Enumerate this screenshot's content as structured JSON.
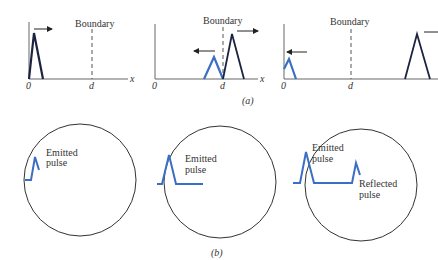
{
  "figure": {
    "part_a": {
      "caption": "(a)",
      "panels": [
        {
          "id": "a1",
          "boundary_label": "Boundary",
          "origin_label": "0",
          "boundary_position_label": "d",
          "axis_label": "x",
          "pulses": [
            {
              "name": "incident-pulse",
              "color": "#1c2340",
              "direction": "right"
            }
          ]
        },
        {
          "id": "a2",
          "boundary_label": "Boundary",
          "origin_label": "0",
          "boundary_position_label": "d",
          "axis_label": "x",
          "pulses": [
            {
              "name": "reflected-pulse",
              "color": "#3a6fc4",
              "direction": "left"
            },
            {
              "name": "transmitted-pulse",
              "color": "#1c2340",
              "direction": "right"
            }
          ]
        },
        {
          "id": "a3",
          "boundary_label": "Boundary",
          "origin_label": "0",
          "boundary_position_label": "d",
          "pulses": [
            {
              "name": "reflected-pulse",
              "color": "#3a6fc4",
              "direction": "left"
            },
            {
              "name": "transmitted-pulse",
              "color": "#1c2340",
              "direction": "right"
            }
          ]
        }
      ]
    },
    "part_b": {
      "caption": "(b)",
      "panels": [
        {
          "id": "b1",
          "labels": {
            "emitted_line1": "Emitted",
            "emitted_line2": "pulse"
          }
        },
        {
          "id": "b2",
          "labels": {
            "emitted_line1": "Emitted",
            "emitted_line2": "pulse"
          }
        },
        {
          "id": "b3",
          "labels": {
            "emitted_line1": "Emitted",
            "emitted_line2": "pulse",
            "reflected_line1": "Reflected",
            "reflected_line2": "pulse"
          }
        }
      ]
    },
    "colors": {
      "incident": "#1c2340",
      "reflected": "#3a6fc4",
      "axis": "#555555",
      "circle": "#333333"
    }
  }
}
